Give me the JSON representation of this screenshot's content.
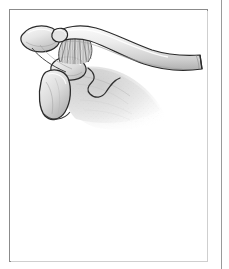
{
  "page": {
    "background_color": "#ffffff",
    "width": 229,
    "height": 269
  },
  "figure": {
    "type": "anatomical-line-illustration",
    "subject": "shoulder girdle",
    "view": "superior-anterior oblique",
    "style": "grayscale pen-and-ink with stipple shading",
    "frame": {
      "border_color": "#8b8b8b",
      "border_width_px": 1,
      "x": 9,
      "y": 9,
      "width": 199,
      "height": 253,
      "fill_color": "#ffffff"
    },
    "gutter_rule": {
      "color": "#9a9a9a",
      "x": 221,
      "width": 1
    },
    "palette": {
      "outline": "#2b2b2b",
      "bone_light": "#f2f2f2",
      "bone_mid": "#d8d8d8",
      "bone_shadow": "#b3b3b3",
      "deep_shadow": "#8f8f8f",
      "ligament_fiber": "#6e6e6e",
      "fade_edge": "#ffffff"
    },
    "structures": [
      {
        "id": "clavicle",
        "label": "clavicle",
        "description": "long curved bone spanning from upper-left to right, ending in a flat cut (osteotomy) surface at the right"
      },
      {
        "id": "acromion",
        "label": "acromion",
        "description": "rounded flattened process at the far upper left"
      },
      {
        "id": "acromioclavicular-joint",
        "label": "acromioclavicular joint",
        "description": "junction between acromion and lateral clavicle"
      },
      {
        "id": "coracoclavicular-ligament",
        "label": "coracoclavicular ligament",
        "description": "vertically hatched fibre bundle running from clavicle down to coracoid process"
      },
      {
        "id": "coracoid-process",
        "label": "coracoid process",
        "description": "hook shaped process below the clavicle, anchoring the ligament"
      },
      {
        "id": "glenoid-humeral-head",
        "label": "glenoid / humeral head",
        "description": "rounded articular mass below the coracoid at lower left"
      },
      {
        "id": "scapula-body",
        "label": "scapula body",
        "description": "broad shaded plate fading into the white background toward the lower right"
      },
      {
        "id": "scapular-spine",
        "label": "scapular spine",
        "description": "ridge line descending from the acromion across the scapula body"
      }
    ]
  }
}
